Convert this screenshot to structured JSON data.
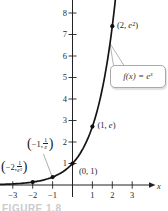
{
  "figure_caption": "FIGURE 1.8",
  "chart_data": {
    "type": "line",
    "function_label": "f(x) = e^x",
    "function": "exp",
    "x_axis_label": "x",
    "grid": false,
    "xlim": [
      -3.6,
      4.8
    ],
    "ylim": [
      -1.2,
      8.6
    ],
    "x_ticks": [
      {
        "value": -3,
        "label": "−3"
      },
      {
        "value": -2,
        "label": "−2"
      },
      {
        "value": -1,
        "label": "−1"
      },
      {
        "value": 1,
        "label": "1"
      },
      {
        "value": 2,
        "label": "2"
      },
      {
        "value": 3,
        "label": "3"
      }
    ],
    "y_ticks": [
      {
        "value": 1,
        "label": "1"
      },
      {
        "value": 2,
        "label": "2"
      },
      {
        "value": 3,
        "label": "3"
      },
      {
        "value": 4,
        "label": "4"
      },
      {
        "value": 5,
        "label": "5"
      },
      {
        "value": 6,
        "label": "6"
      },
      {
        "value": 7,
        "label": "7"
      },
      {
        "value": 8,
        "label": "8"
      }
    ],
    "marked_points": [
      {
        "x": -2,
        "y": 0.1353,
        "label": "(−2, 1/e²)"
      },
      {
        "x": -1,
        "y": 0.3679,
        "label": "(−1, 1/e)"
      },
      {
        "x": 0,
        "y": 1,
        "label": "(0, 1)"
      },
      {
        "x": 1,
        "y": 2.7183,
        "label": "(1, e)"
      },
      {
        "x": 2,
        "y": 7.3891,
        "label": "(2, e²)"
      }
    ],
    "legend_position": "callout bubble pointing to curve"
  },
  "labels": {
    "x_axis": "x",
    "p0": {
      "text": "(0, 1)"
    },
    "p1": {
      "pre": "(1, ",
      "var": "e",
      "post": ")"
    },
    "p2": {
      "pre": "(2, ",
      "var": "e",
      "sup": "2",
      "post": ")"
    },
    "n1": {
      "open": "(",
      "pre": "−1, ",
      "num": "1",
      "den": "e",
      "den_sup": "",
      "close": ")"
    },
    "n2": {
      "open": "(",
      "pre": "−2, ",
      "num": "1",
      "den": "e",
      "den_sup": "2",
      "close": ")"
    },
    "callout": {
      "base": "f(x) = e",
      "sup": "x"
    }
  }
}
